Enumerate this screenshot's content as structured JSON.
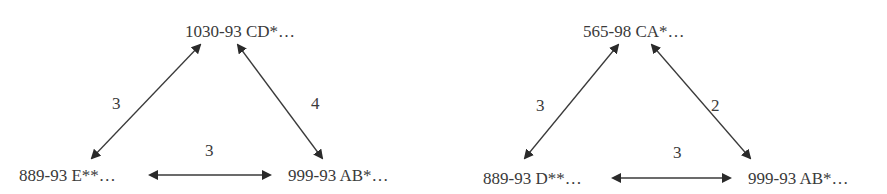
{
  "diagrams": [
    {
      "nodes": {
        "top": "1030-93 CD*…",
        "bottom_left": "889-93 E**…",
        "bottom_right": "999-93 AB*…"
      },
      "edges": [
        {
          "from": "top",
          "to": "bottom_left",
          "weight": "3",
          "bidirectional": true
        },
        {
          "from": "top",
          "to": "bottom_right",
          "weight": "4",
          "bidirectional": true
        },
        {
          "from": "bottom_left",
          "to": "bottom_right",
          "weight": "3",
          "bidirectional": true
        }
      ]
    },
    {
      "nodes": {
        "top": "565-98 CA*…",
        "bottom_left": "889-93 D**…",
        "bottom_right": "999-93 AB*…"
      },
      "edges": [
        {
          "from": "top",
          "to": "bottom_left",
          "weight": "3",
          "bidirectional": true
        },
        {
          "from": "top",
          "to": "bottom_right",
          "weight": "2",
          "bidirectional": true
        },
        {
          "from": "bottom_left",
          "to": "bottom_right",
          "weight": "3",
          "bidirectional": true
        }
      ]
    }
  ],
  "colors": {
    "line": "#3a3a3a",
    "text": "#3a3a3a",
    "background": "#ffffff"
  }
}
